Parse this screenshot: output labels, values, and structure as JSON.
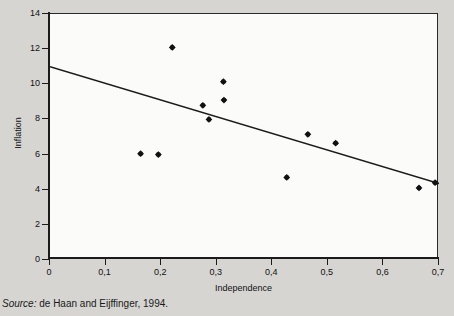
{
  "figure": {
    "source_label": "Source:",
    "source_text": " de Haan and Eijffinger, 1994.",
    "background_color": "#d6d5d1",
    "plot_background_color": "#fbfbfa",
    "ink_color": "#1b1b1b"
  },
  "chart_data": {
    "type": "scatter",
    "title": "",
    "xlabel": "Independence",
    "ylabel": "Inflation",
    "xlim": [
      0,
      0.7
    ],
    "ylim": [
      0,
      14
    ],
    "grid": false,
    "legend": null,
    "xticks": [
      0,
      0.1,
      0.2,
      0.3,
      0.4,
      0.5,
      0.6,
      0.7
    ],
    "xticklabels": [
      "0",
      "0,1",
      "0,2",
      "0,3",
      "0,4",
      "0,5",
      "0,6",
      "0,7"
    ],
    "yticks": [
      0,
      2,
      4,
      6,
      8,
      10,
      12,
      14
    ],
    "yticklabels": [
      "0",
      "2",
      "4",
      "6",
      "8",
      "10",
      "12",
      "14"
    ],
    "marker": "diamond",
    "marker_color": "#111111",
    "points": [
      {
        "x": 0.163,
        "y": 6.05
      },
      {
        "x": 0.195,
        "y": 6.0
      },
      {
        "x": 0.22,
        "y": 12.1
      },
      {
        "x": 0.275,
        "y": 8.8
      },
      {
        "x": 0.286,
        "y": 8.0
      },
      {
        "x": 0.312,
        "y": 10.15
      },
      {
        "x": 0.313,
        "y": 9.1
      },
      {
        "x": 0.426,
        "y": 4.7
      },
      {
        "x": 0.464,
        "y": 7.15
      },
      {
        "x": 0.514,
        "y": 6.65
      },
      {
        "x": 0.664,
        "y": 4.1
      },
      {
        "x": 0.693,
        "y": 4.4
      }
    ],
    "trendline": {
      "type": "linear",
      "x_start": 0.0,
      "y_start": 11.0,
      "x_end": 0.7,
      "y_end": 4.35,
      "color": "#1b1b1b"
    }
  }
}
